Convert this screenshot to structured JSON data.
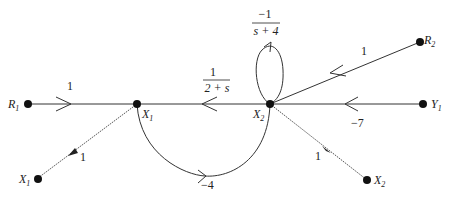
{
  "diagram": {
    "type": "signal-flow-graph",
    "nodes": [
      {
        "id": "R1",
        "label": "R",
        "sub": "1"
      },
      {
        "id": "X1",
        "label": "X",
        "sub": "1"
      },
      {
        "id": "X2",
        "label": "X",
        "sub": "2"
      },
      {
        "id": "Y1",
        "label": "Y",
        "sub": "1"
      },
      {
        "id": "R2",
        "label": "R",
        "sub": "2"
      },
      {
        "id": "X1out",
        "label": "X",
        "sub": "1"
      },
      {
        "id": "X2out",
        "label": "X",
        "sub": "2"
      }
    ],
    "edges": [
      {
        "from": "R1",
        "to": "X1",
        "gain": "1"
      },
      {
        "from": "X2",
        "to": "X1",
        "gain_num": "1",
        "gain_den": "2 + s"
      },
      {
        "from": "X2",
        "to": "X2",
        "gain_num": "−1",
        "gain_den": "s + 4"
      },
      {
        "from": "R2",
        "to": "X2",
        "gain": "1"
      },
      {
        "from": "Y1",
        "to": "X2",
        "gain": "−7"
      },
      {
        "from": "X1",
        "to": "X2",
        "gain": "−4"
      },
      {
        "from": "X1",
        "to": "X1out",
        "gain": "1"
      },
      {
        "from": "X2",
        "to": "X2out",
        "gain": "1"
      }
    ]
  }
}
